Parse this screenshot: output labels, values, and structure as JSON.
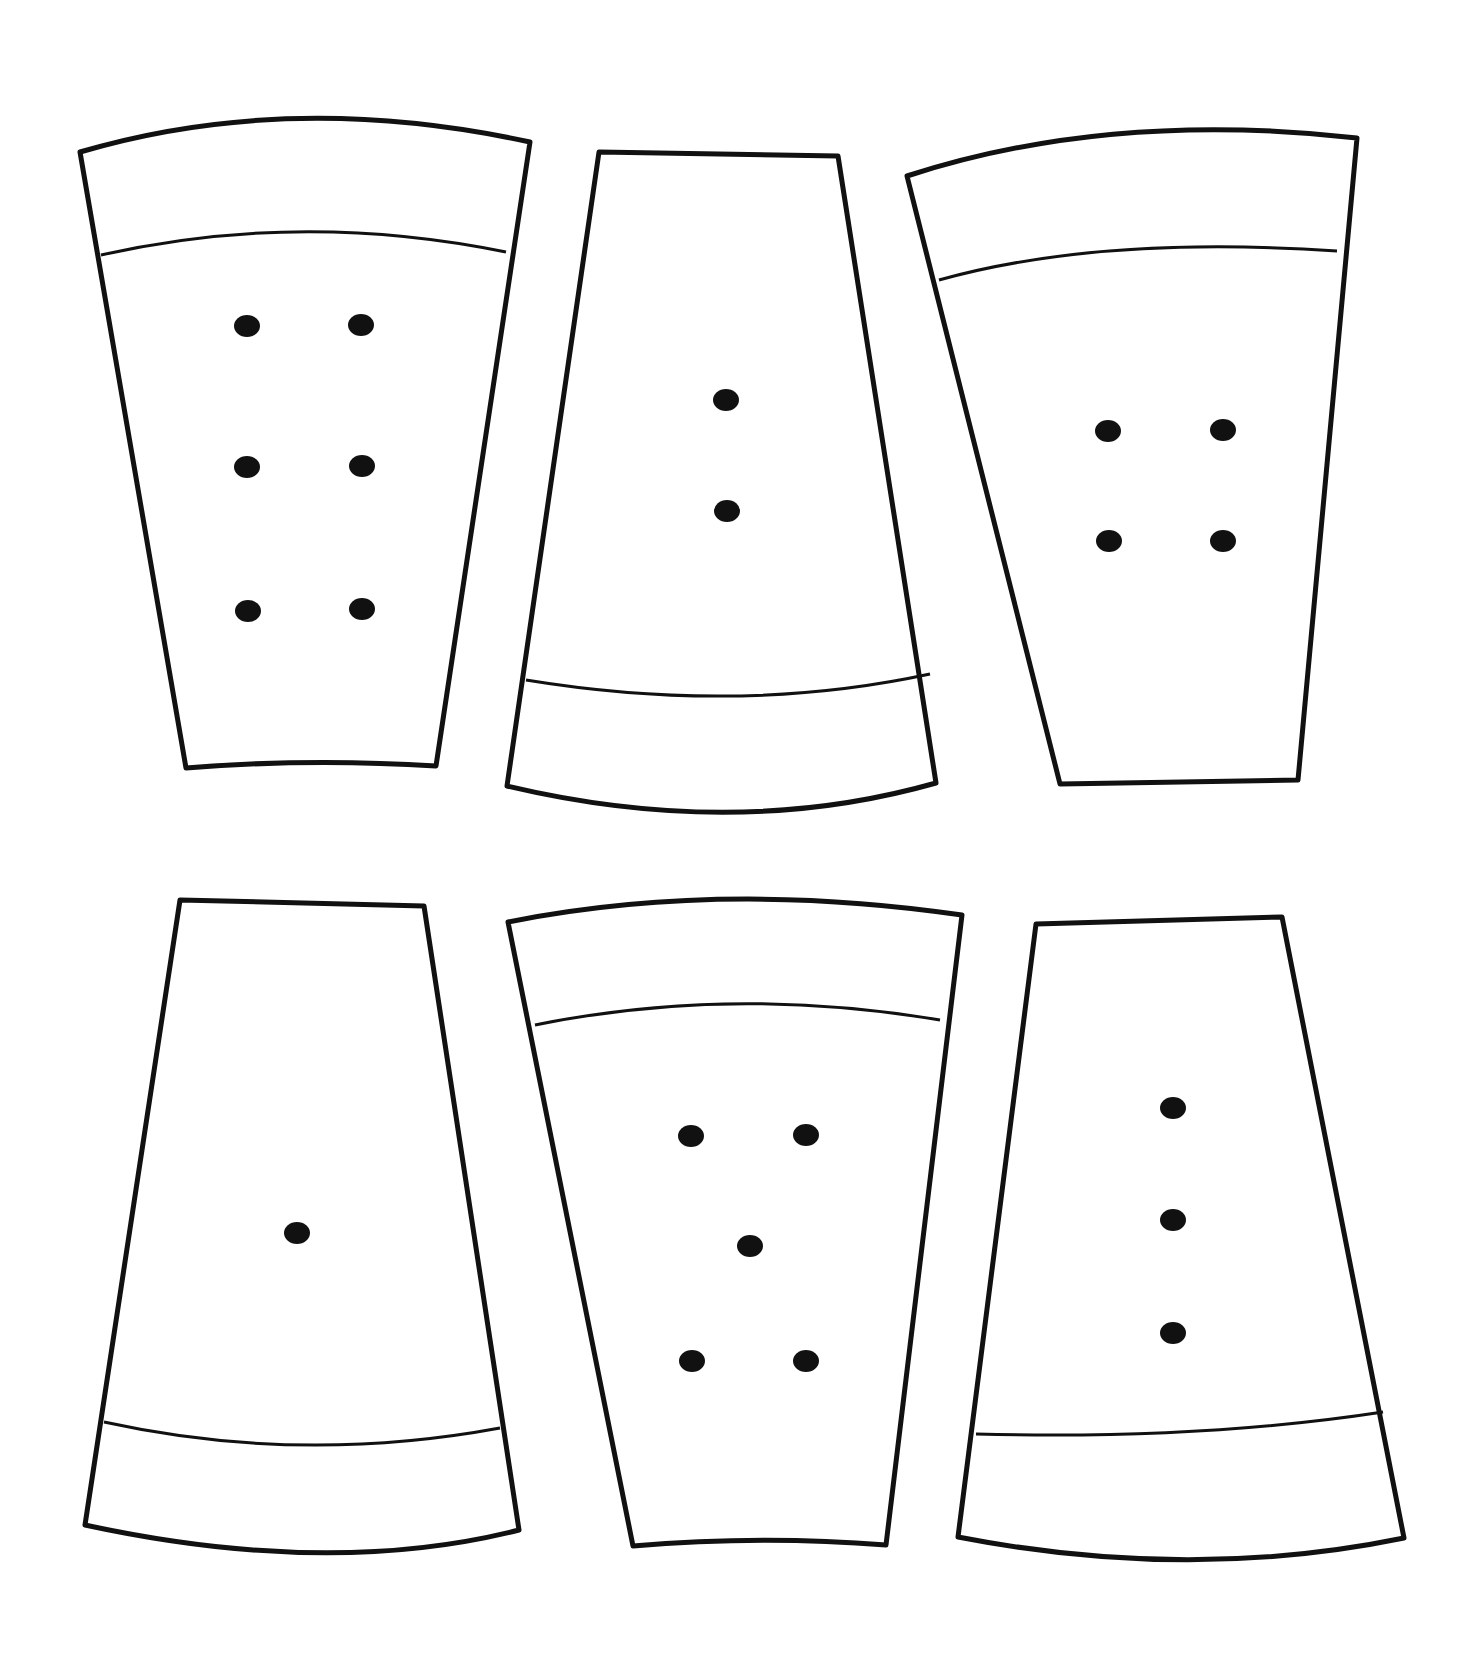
{
  "slices": [
    {
      "id": "slice-1",
      "seeds": 6,
      "rind": "top",
      "outline": "M80,152 Q290,90 530,142 L436,766 Q310,758 186,768 Z",
      "rind_line": "M101,255 Q300,210 506,252",
      "seed_points": [
        [
          247,
          326
        ],
        [
          361,
          325
        ],
        [
          247,
          467
        ],
        [
          362,
          466
        ],
        [
          248,
          611
        ],
        [
          362,
          609
        ]
      ]
    },
    {
      "id": "slice-2",
      "seeds": 2,
      "rind": "bottom",
      "outline": "M599,152 L838,156 L936,783 Q735,840 507,786 Z",
      "rind_line": "M526,680 Q740,715 930,674",
      "seed_points": [
        [
          726,
          400
        ],
        [
          727,
          511
        ]
      ]
    },
    {
      "id": "slice-3",
      "seeds": 4,
      "rind": "top",
      "outline": "M907,176 Q1110,110 1357,138 L1298,780 L1060,784 Z",
      "rind_line": "M939,280 Q1100,235 1337,251",
      "seed_points": [
        [
          1108,
          431
        ],
        [
          1223,
          430
        ],
        [
          1109,
          541
        ],
        [
          1223,
          541
        ]
      ]
    },
    {
      "id": "slice-4",
      "seeds": 1,
      "rind": "bottom",
      "outline": "M180,900 L424,906 L519,1530 Q330,1578 85,1525 Z",
      "rind_line": "M104,1422 Q300,1465 500,1428",
      "seed_points": [
        [
          297,
          1233
        ]
      ]
    },
    {
      "id": "slice-5",
      "seeds": 5,
      "rind": "top",
      "outline": "M508,922 Q720,880 962,915 L886,1545 Q760,1535 633,1546 Z",
      "rind_line": "M535,1025 Q730,985 940,1020",
      "seed_points": [
        [
          691,
          1136
        ],
        [
          806,
          1135
        ],
        [
          750,
          1246
        ],
        [
          692,
          1361
        ],
        [
          806,
          1361
        ]
      ]
    },
    {
      "id": "slice-6",
      "seeds": 3,
      "rind": "bottom",
      "outline": "M1036,924 L1282,917 L1404,1538 Q1190,1582 958,1537 Z",
      "rind_line": "M976,1434 Q1200,1440 1383,1412",
      "seed_points": [
        [
          1173,
          1108
        ],
        [
          1173,
          1220
        ],
        [
          1173,
          1333
        ]
      ]
    }
  ]
}
